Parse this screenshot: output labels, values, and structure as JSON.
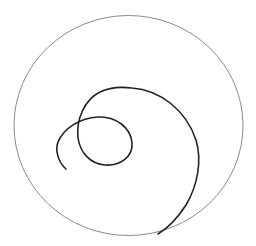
{
  "canvas": {
    "width": 256,
    "height": 246,
    "background": "#ffffff"
  },
  "outer_circle": {
    "cx": 128.5,
    "cy": 125.5,
    "rx": 114.5,
    "ry": 110,
    "stroke": "#8a8a8a",
    "stroke_width": 1
  },
  "spiral_curve": {
    "stroke": "#222222",
    "stroke_width": 1.6,
    "path": "M66,169 C58,162 55,150 58,142 C64,128 80,118 98,117 C116,116 131,128 132,143 C133,157 120,166 105,165 C90,164 80,152 78,138 C76,120 84,100 100,92 C112,86 124,87 132,88 C160,90 186,110 196,140 C202,160 198,185 186,205 C177,219 168,228 158,234"
  }
}
